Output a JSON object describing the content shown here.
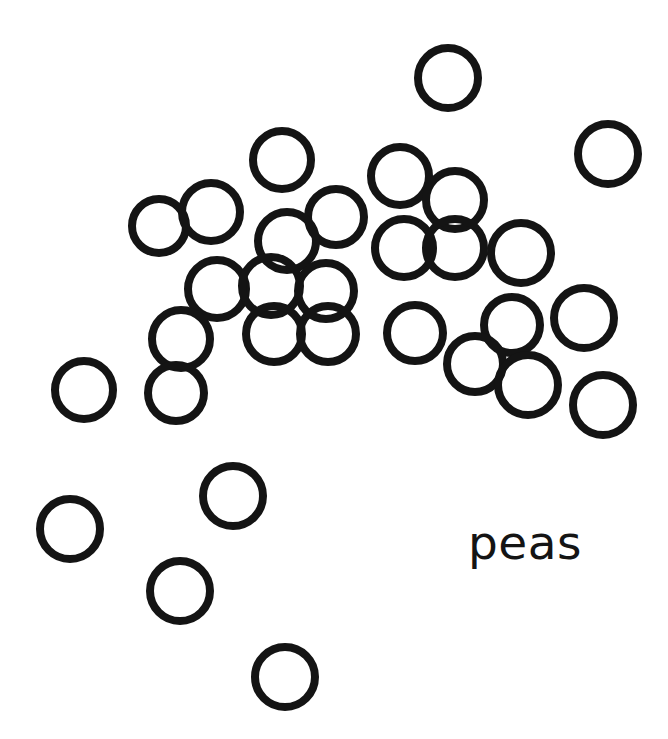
{
  "page": {
    "title": "peas",
    "background_color": "#ffffff",
    "width": 668,
    "height": 739
  },
  "caption": {
    "text": "peas",
    "color": "#141414",
    "x": 468,
    "y": 519,
    "font_size": 47
  },
  "chart_data": {
    "type": "scatter",
    "title": "peas",
    "xlabel": "",
    "ylabel": "",
    "xlim": [
      0,
      668
    ],
    "ylim": [
      0,
      739
    ],
    "grid": false,
    "legend": null,
    "marker": "open-circle",
    "marker_stroke_color": "#141414",
    "marker_stroke_width": 8,
    "marker_fill": "none",
    "count": 36,
    "annotations": [
      {
        "text": "peas",
        "x": 468,
        "y": 543
      }
    ],
    "points": [
      {
        "x": 448,
        "y": 78,
        "r": 30
      },
      {
        "x": 608,
        "y": 154,
        "r": 30
      },
      {
        "x": 282,
        "y": 160,
        "r": 29
      },
      {
        "x": 400,
        "y": 176,
        "r": 29
      },
      {
        "x": 455,
        "y": 200,
        "r": 29
      },
      {
        "x": 159,
        "y": 226,
        "r": 27
      },
      {
        "x": 211,
        "y": 212,
        "r": 29
      },
      {
        "x": 336,
        "y": 217,
        "r": 28
      },
      {
        "x": 287,
        "y": 241,
        "r": 29
      },
      {
        "x": 404,
        "y": 248,
        "r": 29
      },
      {
        "x": 455,
        "y": 248,
        "r": 29
      },
      {
        "x": 521,
        "y": 253,
        "r": 30
      },
      {
        "x": 217,
        "y": 289,
        "r": 29
      },
      {
        "x": 271,
        "y": 286,
        "r": 29
      },
      {
        "x": 326,
        "y": 291,
        "r": 28
      },
      {
        "x": 181,
        "y": 339,
        "r": 29
      },
      {
        "x": 274,
        "y": 334,
        "r": 28
      },
      {
        "x": 328,
        "y": 334,
        "r": 28
      },
      {
        "x": 415,
        "y": 333,
        "r": 28
      },
      {
        "x": 512,
        "y": 325,
        "r": 28
      },
      {
        "x": 584,
        "y": 318,
        "r": 30
      },
      {
        "x": 176,
        "y": 393,
        "r": 28
      },
      {
        "x": 475,
        "y": 364,
        "r": 28
      },
      {
        "x": 528,
        "y": 385,
        "r": 30
      },
      {
        "x": 603,
        "y": 405,
        "r": 30
      },
      {
        "x": 84,
        "y": 390,
        "r": 29
      },
      {
        "x": 233,
        "y": 496,
        "r": 30
      },
      {
        "x": 70,
        "y": 529,
        "r": 30
      },
      {
        "x": 180,
        "y": 591,
        "r": 30
      },
      {
        "x": 285,
        "y": 677,
        "r": 30
      }
    ]
  }
}
